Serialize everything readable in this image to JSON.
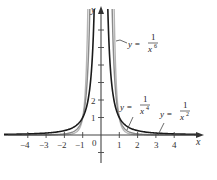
{
  "chart_data": {
    "type": "line",
    "title": "",
    "xlabel": "x",
    "ylabel": "y",
    "xlim": [
      -5,
      5.5
    ],
    "ylim": [
      -1.5,
      7.3
    ],
    "grid": false,
    "x_ticks": [
      -4,
      -3,
      -2,
      -1,
      1,
      2,
      3,
      4
    ],
    "x_tick_labels": [
      "−4",
      "−3",
      "−2",
      "−1",
      "1",
      "2",
      "3",
      "4"
    ],
    "y_ticks": [
      -1,
      1,
      2,
      3,
      4,
      5,
      6
    ],
    "y_tick_labels": [
      "1",
      "2"
    ],
    "origin_label": "0",
    "series": [
      {
        "name": "y = 1/x^2",
        "exponent": 2,
        "color": "#1a1a1a",
        "label_base": "1",
        "label_den": "x",
        "label_sup": "2"
      },
      {
        "name": "y = 1/x^4",
        "exponent": 4,
        "color": "#8a8a8a",
        "label_base": "1",
        "label_den": "x",
        "label_sup": "4"
      },
      {
        "name": "y = 1/x^6",
        "exponent": 6,
        "color": "#b5b5b5",
        "label_base": "1",
        "label_den": "x",
        "label_sup": "6"
      }
    ],
    "annotations": [
      {
        "text": "y = 1/x^6",
        "target_series": "y = 1/x^6"
      },
      {
        "text": "y = 1/x^4",
        "target_series": "y = 1/x^4"
      },
      {
        "text": "y = 1/x^2",
        "target_series": "y = 1/x^2"
      }
    ]
  },
  "labels": {
    "x_axis": "x",
    "y_axis": "y",
    "origin": "0",
    "y_prefix": "y =",
    "numerator": "1",
    "den": "x",
    "sup6": "6",
    "sup4": "4",
    "sup2": "2",
    "xt": [
      "−4",
      "−3",
      "−2",
      "−1",
      "1",
      "2",
      "3",
      "4"
    ],
    "yt": [
      "1",
      "2"
    ]
  }
}
